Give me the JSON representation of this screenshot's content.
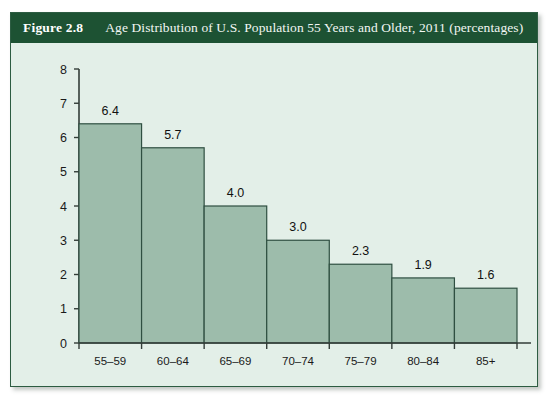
{
  "figure": {
    "number": "Figure 2.8",
    "caption": "Age Distribution of U.S. Population 55 Years and Older, 2011 (percentages)"
  },
  "colors": {
    "header_band": "#1d5233",
    "panel_border": "#2d5c42",
    "plot_background": "#e3efe8",
    "bar_fill": "#9dbcab",
    "bar_stroke": "#2f4f41",
    "axis": "#333d38",
    "page_background": "#ffffff"
  },
  "chart_data": {
    "type": "bar",
    "title": "Age Distribution of U.S. Population 55 Years and Older, 2011 (percentages)",
    "categories": [
      "55–59",
      "60–64",
      "65–69",
      "70–74",
      "75–79",
      "80–84",
      "85+"
    ],
    "values": [
      6.4,
      5.7,
      4.0,
      3.0,
      2.3,
      1.9,
      1.6
    ],
    "value_labels": [
      "6.4",
      "5.7",
      "4.0",
      "3.0",
      "2.3",
      "1.9",
      "1.6"
    ],
    "xlabel": "",
    "ylabel": "",
    "ylim": [
      0,
      8
    ],
    "ytick_values": [
      0,
      1,
      2,
      3,
      4,
      5,
      6,
      7,
      8
    ],
    "ytick_labels": [
      "0",
      "1",
      "2",
      "3",
      "4",
      "5",
      "6",
      "7",
      "8"
    ],
    "grid": false,
    "legend": null,
    "bars_contiguous": true
  }
}
